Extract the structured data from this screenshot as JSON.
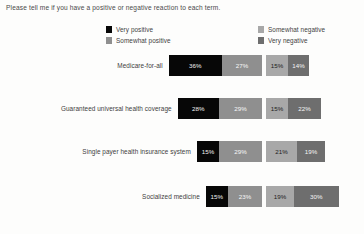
{
  "question": "Please tell me if you have a positive or negative reaction to each term.",
  "legend": {
    "left_column": [
      {
        "label": "Very positive",
        "color": "#070707",
        "key": "very_positive"
      },
      {
        "label": "Somewhat positive",
        "color": "#8f8f8f",
        "key": "somewhat_positive"
      }
    ],
    "right_column": [
      {
        "label": "Somewhat negative",
        "color": "#a8a8a8",
        "key": "somewhat_negative"
      },
      {
        "label": "Very negative",
        "color": "#6e6e6e",
        "key": "very_negative"
      }
    ]
  },
  "chart_data": {
    "type": "bar",
    "subtype": "diverging-stacked-bar",
    "title": "Please tell me if you have a positive or negative reaction to each term.",
    "xlabel": "",
    "ylabel": "",
    "grid": false,
    "legend_position": "top",
    "value_format": "percent",
    "categories": [
      "Medicare-for-all",
      "Guaranteed universal health coverage",
      "Single payer health insurance system",
      "Socialized medicine"
    ],
    "series": [
      {
        "name": "Very positive",
        "color": "#070707",
        "side": "positive",
        "values": [
          36,
          28,
          15,
          15
        ]
      },
      {
        "name": "Somewhat positive",
        "color": "#8f8f8f",
        "side": "positive",
        "values": [
          27,
          29,
          29,
          23
        ]
      },
      {
        "name": "Somewhat negative",
        "color": "#a8a8a8",
        "side": "negative",
        "values": [
          15,
          15,
          21,
          19
        ]
      },
      {
        "name": "Very negative",
        "color": "#6e6e6e",
        "side": "negative",
        "values": [
          14,
          22,
          19,
          30
        ]
      }
    ],
    "rows": [
      {
        "label": "Medicare-for-all",
        "very_positive": 36,
        "somewhat_positive": 27,
        "somewhat_negative": 15,
        "very_negative": 14,
        "very_positive_text": "36%",
        "somewhat_positive_text": "27%",
        "somewhat_negative_text": "15%",
        "very_negative_text": "14%"
      },
      {
        "label": "Guaranteed universal health coverage",
        "very_positive": 28,
        "somewhat_positive": 29,
        "somewhat_negative": 15,
        "very_negative": 22,
        "very_positive_text": "28%",
        "somewhat_positive_text": "29%",
        "somewhat_negative_text": "15%",
        "very_negative_text": "22%"
      },
      {
        "label": "Single payer health insurance system",
        "very_positive": 15,
        "somewhat_positive": 29,
        "somewhat_negative": 21,
        "very_negative": 19,
        "very_positive_text": "15%",
        "somewhat_positive_text": "29%",
        "somewhat_negative_text": "21%",
        "very_negative_text": "19%"
      },
      {
        "label": "Socialized medicine",
        "very_positive": 15,
        "somewhat_positive": 23,
        "somewhat_negative": 19,
        "very_negative": 30,
        "very_positive_text": "15%",
        "somewhat_positive_text": "23%",
        "somewhat_negative_text": "19%",
        "very_negative_text": "30%"
      }
    ]
  },
  "layout": {
    "center_x": 264,
    "px_per_percent": 1.48,
    "gap": 4,
    "row_tops": [
      0,
      43,
      86,
      131
    ]
  }
}
